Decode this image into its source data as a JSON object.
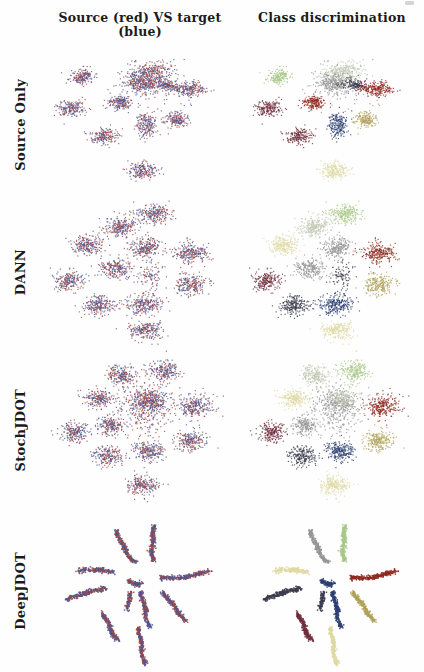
{
  "columns": [
    {
      "label": "Source (red) VS target (blue)"
    },
    {
      "label": "Class discrimination"
    }
  ],
  "rows": [
    {
      "label": "Source Only"
    },
    {
      "label": "DANN"
    },
    {
      "label": "StochJDOT"
    },
    {
      "label": "DeepJDOT"
    }
  ],
  "colors": {
    "source": "#9e4742",
    "target": "#4a5796",
    "classes": [
      "#a8c888",
      "#969696",
      "#8e2a20",
      "#2d3f72",
      "#b0a258",
      "#ded9a2",
      "#71303d",
      "#c0c6b2",
      "#3c3c4e",
      "#bfa888"
    ]
  },
  "chart_data": {
    "type": "scatter",
    "legend_position": "none",
    "grid": false,
    "rows": [
      {
        "name": "source-only",
        "blobs": [
          [
            0.55,
            0.12,
            0.05,
            0.035,
            280,
            7
          ],
          [
            0.5,
            0.2,
            0.045,
            0.03,
            240,
            1
          ],
          [
            0.62,
            0.21,
            0.035,
            0.022,
            160,
            8
          ],
          [
            0.53,
            0.24,
            0.11,
            0.09,
            110,
            1
          ],
          [
            0.74,
            0.24,
            0.045,
            0.025,
            220,
            2
          ],
          [
            0.21,
            0.155,
            0.032,
            0.026,
            180,
            0
          ],
          [
            0.15,
            0.38,
            0.035,
            0.028,
            190,
            6
          ],
          [
            0.4,
            0.33,
            0.03,
            0.025,
            180,
            2
          ],
          [
            0.53,
            0.5,
            0.026,
            0.045,
            200,
            3
          ],
          [
            0.68,
            0.46,
            0.03,
            0.026,
            170,
            4
          ],
          [
            0.32,
            0.58,
            0.034,
            0.028,
            190,
            6
          ],
          [
            0.51,
            0.82,
            0.036,
            0.03,
            200,
            5
          ]
        ],
        "filaments": []
      },
      {
        "name": "dann",
        "blobs": [
          [
            0.57,
            0.12,
            0.04,
            0.032,
            240,
            0
          ],
          [
            0.4,
            0.2,
            0.042,
            0.032,
            240,
            7
          ],
          [
            0.24,
            0.32,
            0.038,
            0.03,
            220,
            5
          ],
          [
            0.53,
            0.33,
            0.04,
            0.032,
            240,
            1
          ],
          [
            0.75,
            0.37,
            0.045,
            0.035,
            250,
            2
          ],
          [
            0.14,
            0.55,
            0.036,
            0.03,
            210,
            6
          ],
          [
            0.38,
            0.47,
            0.04,
            0.03,
            230,
            1
          ],
          [
            0.56,
            0.52,
            0.03,
            0.04,
            90,
            8
          ],
          [
            0.75,
            0.58,
            0.04,
            0.032,
            220,
            4
          ],
          [
            0.29,
            0.71,
            0.04,
            0.03,
            230,
            8
          ],
          [
            0.52,
            0.7,
            0.046,
            0.032,
            250,
            3
          ],
          [
            0.53,
            0.87,
            0.04,
            0.028,
            220,
            5
          ]
        ],
        "filaments": []
      },
      {
        "name": "stochjdot",
        "blobs": [
          [
            0.53,
            0.33,
            0.065,
            0.05,
            380,
            1
          ],
          [
            0.55,
            0.3,
            0.04,
            0.03,
            150,
            7
          ],
          [
            0.53,
            0.45,
            0.055,
            0.065,
            90,
            1
          ],
          [
            0.41,
            0.16,
            0.036,
            0.03,
            220,
            7
          ],
          [
            0.62,
            0.13,
            0.038,
            0.03,
            220,
            0
          ],
          [
            0.29,
            0.3,
            0.036,
            0.028,
            210,
            5
          ],
          [
            0.77,
            0.35,
            0.045,
            0.035,
            260,
            2
          ],
          [
            0.17,
            0.51,
            0.036,
            0.03,
            210,
            6
          ],
          [
            0.35,
            0.47,
            0.034,
            0.03,
            200,
            1
          ],
          [
            0.75,
            0.56,
            0.04,
            0.032,
            220,
            4
          ],
          [
            0.54,
            0.63,
            0.038,
            0.032,
            230,
            3
          ],
          [
            0.34,
            0.66,
            0.036,
            0.03,
            210,
            8
          ],
          [
            0.51,
            0.84,
            0.04,
            0.03,
            220,
            5
          ]
        ],
        "filaments": []
      },
      {
        "name": "deepjdot",
        "blobs": [],
        "filaments": [
          [
            0.38,
            0.12,
            0.41,
            0.24,
            0.47,
            0.32,
            250,
            1
          ],
          [
            0.57,
            0.09,
            0.55,
            0.2,
            0.56,
            0.31,
            250,
            0
          ],
          [
            0.19,
            0.37,
            0.28,
            0.355,
            0.36,
            0.38,
            190,
            5
          ],
          [
            0.44,
            0.43,
            0.47,
            0.46,
            0.5,
            0.45,
            130,
            3
          ],
          [
            0.6,
            0.41,
            0.72,
            0.43,
            0.84,
            0.37,
            270,
            2
          ],
          [
            0.13,
            0.55,
            0.22,
            0.5,
            0.32,
            0.48,
            230,
            8
          ],
          [
            0.5,
            0.5,
            0.52,
            0.6,
            0.54,
            0.72,
            230,
            3
          ],
          [
            0.61,
            0.5,
            0.66,
            0.58,
            0.72,
            0.68,
            230,
            4
          ],
          [
            0.31,
            0.63,
            0.34,
            0.71,
            0.38,
            0.8,
            230,
            6
          ],
          [
            0.49,
            0.72,
            0.5,
            0.83,
            0.52,
            0.95,
            240,
            5
          ],
          [
            0.455,
            0.5,
            0.44,
            0.55,
            0.43,
            0.62,
            100,
            8
          ]
        ]
      }
    ]
  }
}
